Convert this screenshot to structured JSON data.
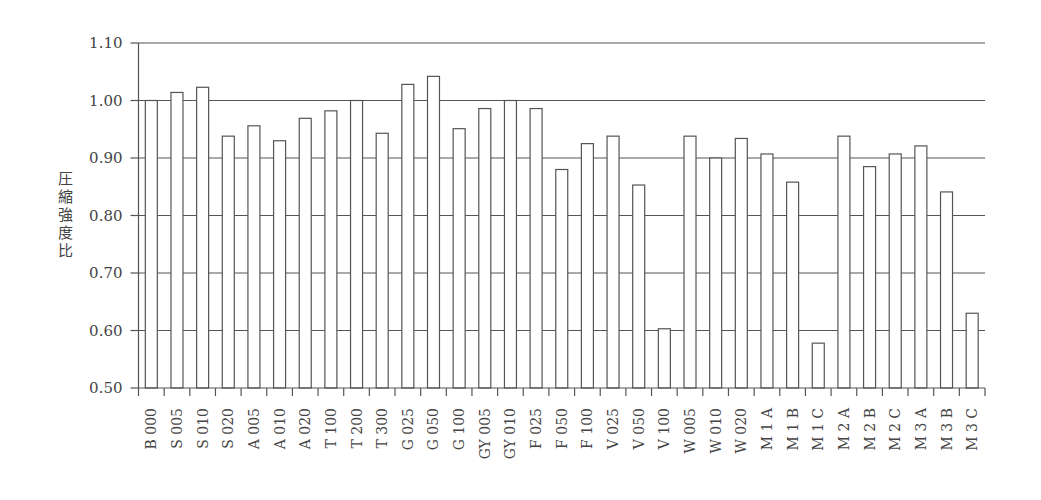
{
  "chart_data": {
    "type": "bar",
    "title": "",
    "xlabel": "",
    "ylabel": "圧縮強度比",
    "ylim": [
      0.5,
      1.1
    ],
    "yticks": [
      "0.50",
      "0.60",
      "0.70",
      "0.80",
      "0.90",
      "1.00",
      "1.10"
    ],
    "grid": true,
    "legend": null,
    "categories": [
      "B 000",
      "S 005",
      "S 010",
      "S 020",
      "A 005",
      "A 010",
      "A 020",
      "T 100",
      "T 200",
      "T 300",
      "G 025",
      "G 050",
      "G 100",
      "GY 005",
      "GY 010",
      "F 025",
      "F 050",
      "F 100",
      "V 025",
      "V 050",
      "V 100",
      "W 005",
      "W 010",
      "W 020",
      "M 1 A",
      "M 1 B",
      "M 1 C",
      "M 2 A",
      "M 2 B",
      "M 2 C",
      "M 3 A",
      "M 3 B",
      "M 3 C"
    ],
    "values": [
      1.0,
      1.014,
      1.023,
      0.938,
      0.956,
      0.93,
      0.969,
      0.982,
      1.0,
      0.943,
      1.028,
      1.042,
      0.951,
      0.986,
      1.0,
      0.986,
      0.88,
      0.925,
      0.938,
      0.853,
      0.603,
      0.938,
      0.9,
      0.934,
      0.907,
      0.858,
      0.578,
      0.938,
      0.885,
      0.907,
      0.921,
      0.841,
      0.63
    ]
  },
  "colors": {
    "bar_fill": "#ffffff",
    "bar_stroke": "#555555",
    "grid": "#555555",
    "text": "#444444"
  }
}
